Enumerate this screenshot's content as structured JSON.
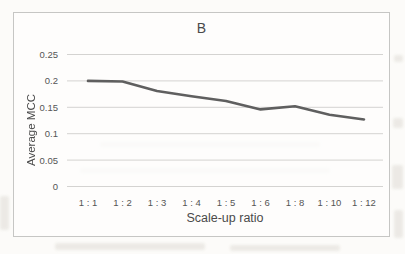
{
  "chart_data": {
    "type": "line",
    "title": "B",
    "xlabel": "Scale-up ratio",
    "ylabel": "Average MCC",
    "categories": [
      "1 : 1",
      "1 : 2",
      "1 : 3",
      "1 : 4",
      "1 : 5",
      "1 : 6",
      "1 : 8",
      "1 : 10",
      "1 : 12"
    ],
    "series": [
      {
        "name": "Average MCC",
        "values": [
          0.2,
          0.199,
          0.181,
          0.171,
          0.162,
          0.146,
          0.152,
          0.136,
          0.127
        ]
      }
    ],
    "ylim": [
      0,
      0.25
    ],
    "yticks": [
      0,
      0.05,
      0.1,
      0.15,
      0.2,
      0.25
    ],
    "ytick_labels": [
      "0",
      "0.05",
      "0.1",
      "0.15",
      "0.2",
      "0.25"
    ],
    "grid": true,
    "legend_position": "none",
    "colors": {
      "line": "#5f5f5f",
      "grid": "#d4d3d1",
      "tick_text": "#555555",
      "title_text": "#4a4a4a",
      "chart_border": "#c6c6c4",
      "page_background": "#fcfbf9"
    }
  }
}
